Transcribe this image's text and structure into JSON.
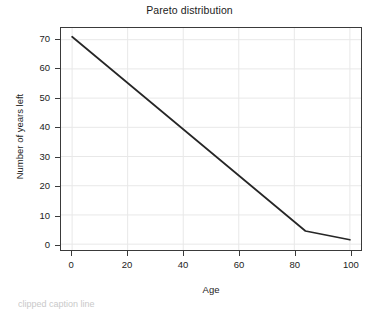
{
  "chart_data": {
    "type": "line",
    "title": "Pareto distribution",
    "xlabel": "Age",
    "ylabel": "Number of years left",
    "xlim": [
      -4,
      104
    ],
    "ylim": [
      -2,
      74
    ],
    "grid": true,
    "legend": null,
    "xticks": [
      0,
      20,
      40,
      60,
      80,
      100
    ],
    "xtick_labels": [
      "0",
      "20",
      "40",
      "60",
      "80",
      "100"
    ],
    "yticks": [
      0,
      10,
      20,
      30,
      40,
      50,
      60,
      70
    ],
    "ytick_labels": [
      "0",
      "10",
      "20",
      "30",
      "40",
      "50",
      "60",
      "70"
    ],
    "series": [
      {
        "name": "Number of years left",
        "color": "#262626",
        "x": [
          0,
          84,
          100
        ],
        "values": [
          71,
          4.5,
          1.5
        ]
      }
    ],
    "annotations": []
  },
  "colors": {
    "line": "#262626",
    "grid": "#e8e8e8",
    "frame": "#3a3a3a",
    "text": "#1c1c1c",
    "background": "#ffffff"
  },
  "caption": {
    "text": "clipped caption line"
  }
}
